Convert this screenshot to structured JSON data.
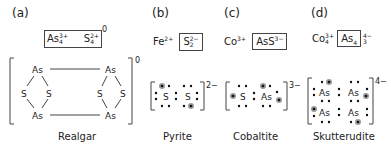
{
  "panels": [
    {
      "label": "(a)",
      "formula": {
        "cation": "As",
        "cation_sub": "4",
        "cation_sup": "3+",
        "anion": "S",
        "anion_sub": "4",
        "anion_sup": "2+",
        "charge": "0"
      },
      "structure": {
        "atoms": [
          "As",
          "S",
          "S",
          "As",
          "As",
          "S",
          "S",
          "As"
        ],
        "charge": "0"
      },
      "name": "Realgar"
    },
    {
      "label": "(b)",
      "formula": {
        "cation": "Fe",
        "cation_sup": "2+",
        "anion": "S",
        "anion_sub": "2",
        "anion_sup": "2−"
      },
      "structure": {
        "atoms": [
          "S",
          "S"
        ],
        "charge": "2−"
      },
      "name": "Pyrite"
    },
    {
      "label": "(c)",
      "formula": {
        "cation": "Co",
        "cation_sup": "3+",
        "anion": "AsS",
        "anion_sup": "3−"
      },
      "structure": {
        "atoms": [
          "S",
          "As"
        ],
        "charge": "3−"
      },
      "name": "Cobaltite"
    },
    {
      "label": "(d)",
      "formula": {
        "cation": "Co",
        "cation_sub": "4",
        "cation_sup": "3+",
        "anion": "As",
        "anion_sub": "4",
        "outer_sup": "4−",
        "outer_sub": "3"
      },
      "structure": {
        "atoms": [
          "As",
          "As",
          "As",
          "As"
        ],
        "charge": "4−"
      },
      "name": "Skutterudite"
    }
  ],
  "colors": {
    "text": "#222222",
    "lines": "#444444",
    "electron_dot": "#111111",
    "shared_electron": "#777777"
  }
}
